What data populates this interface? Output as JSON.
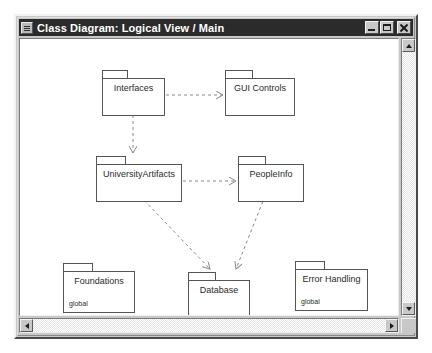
{
  "window": {
    "title": "Class Diagram: Logical View / Main",
    "sysmenu_icon": "system-menu-icon",
    "buttons": {
      "minimize": "Minimize",
      "maximize": "Maximize",
      "close": "Close"
    }
  },
  "diagram": {
    "type": "uml-class-diagram",
    "packages": [
      {
        "id": "interfaces",
        "label": "Interfaces",
        "stereotype": "",
        "x": 82,
        "y": 31,
        "w": 63,
        "h": 38,
        "tab_w": 26
      },
      {
        "id": "gui-controls",
        "label": "GUI Controls",
        "stereotype": "",
        "x": 205,
        "y": 31,
        "w": 70,
        "h": 38,
        "tab_w": 28
      },
      {
        "id": "university-artifacts",
        "label": "UniversityArtifacts",
        "stereotype": "",
        "x": 76,
        "y": 117,
        "w": 86,
        "h": 38,
        "tab_w": 30
      },
      {
        "id": "people-info",
        "label": "PeopleInfo",
        "stereotype": "",
        "x": 218,
        "y": 117,
        "w": 66,
        "h": 38,
        "tab_w": 28
      },
      {
        "id": "foundations",
        "label": "Foundations",
        "stereotype": "global",
        "x": 43,
        "y": 224,
        "w": 72,
        "h": 42,
        "tab_w": 30
      },
      {
        "id": "database",
        "label": "Database",
        "stereotype": "",
        "x": 168,
        "y": 233,
        "w": 62,
        "h": 38,
        "tab_w": 28
      },
      {
        "id": "error-handling",
        "label": "Error Handling",
        "stereotype": "global",
        "x": 275,
        "y": 222,
        "w": 73,
        "h": 42,
        "tab_w": 30
      }
    ],
    "dependencies": [
      {
        "id": "interfaces-to-gui-controls",
        "from": "interfaces",
        "to": "gui-controls"
      },
      {
        "id": "interfaces-to-university-artifacts",
        "from": "interfaces",
        "to": "university-artifacts"
      },
      {
        "id": "university-artifacts-to-people-info",
        "from": "university-artifacts",
        "to": "people-info"
      },
      {
        "id": "university-artifacts-to-database",
        "from": "university-artifacts",
        "to": "database"
      },
      {
        "id": "people-info-to-database",
        "from": "people-info",
        "to": "database"
      }
    ],
    "line_color": "#888888",
    "node_border_color": "#555555",
    "node_fill_color": "#ffffff"
  },
  "scrollbars": {
    "vertical": {
      "up": "Scroll up",
      "down": "Scroll down"
    },
    "horizontal": {
      "left": "Scroll left",
      "right": "Scroll right"
    },
    "grip": "Resize grip"
  }
}
